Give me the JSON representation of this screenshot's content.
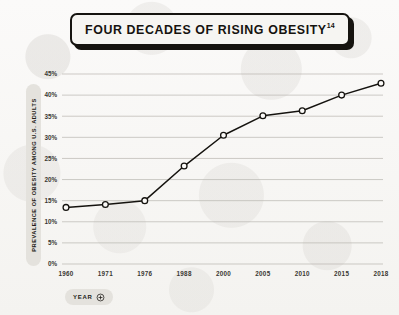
{
  "title": {
    "text": "FOUR DECADES OF RISING OBESITY",
    "footnote": "14"
  },
  "axis_titles": {
    "y_pill": "PREVALENCE OF OBESITY AMONG U.S. ADULTS",
    "x_pill": "YEAR",
    "x_pill_icon": "circle-plus-icon"
  },
  "colors": {
    "ink": "#15130f",
    "paper": "#f8f7f5",
    "grid": "#b9b6b0",
    "pill": "#e4e2dd"
  },
  "chart_data": {
    "type": "line",
    "title": "FOUR DECADES OF RISING OBESITY",
    "xlabel": "YEAR",
    "ylabel": "PREVALENCE OF OBESITY AMONG U.S. ADULTS",
    "categories": [
      "1960",
      "1971",
      "1976",
      "1988",
      "2000",
      "2005",
      "2010",
      "2015",
      "2018"
    ],
    "values": [
      13.4,
      14.1,
      15.0,
      23.2,
      30.5,
      35.1,
      36.3,
      40.0,
      42.8
    ],
    "ytick_labels": [
      "0%",
      "5%",
      "10%",
      "15%",
      "20%",
      "25%",
      "30%",
      "35%",
      "40%",
      "45%"
    ],
    "ytick_values": [
      0,
      5,
      10,
      15,
      20,
      25,
      30,
      35,
      40,
      45
    ],
    "ylim": [
      0,
      45
    ],
    "grid": "horizontal",
    "legend": "none",
    "marker": "open-circle"
  }
}
